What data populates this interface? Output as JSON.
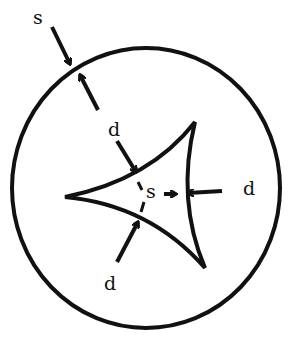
{
  "diagram": {
    "type": "hand-drawn geometric figure",
    "colors": {
      "stroke": "#111111",
      "background": "#ffffff"
    },
    "shapes": {
      "outer_circle": {
        "cx": 146,
        "cy": 188,
        "rx": 134,
        "ry": 140
      },
      "deltoid_cusps": [
        [
          65,
          197
        ],
        [
          195,
          122
        ],
        [
          205,
          268
        ]
      ]
    },
    "labels": {
      "s_outer": "s",
      "d_upper": "d",
      "s_inner": "s",
      "d_right": "d",
      "d_lower": "d"
    }
  }
}
